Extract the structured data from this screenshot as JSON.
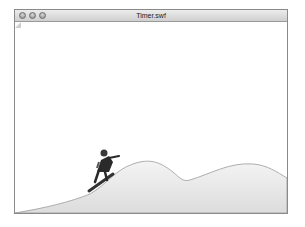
{
  "window": {
    "title": "Timer.swf",
    "controls": [
      "close",
      "minimize",
      "zoom"
    ]
  },
  "stage": {
    "scene": "snowboarder riding over snowy hills",
    "colors": {
      "snow_fill": "#e6e6e6",
      "hill_outline": "#9a9a9a",
      "rider": "#2a2a2a"
    }
  }
}
